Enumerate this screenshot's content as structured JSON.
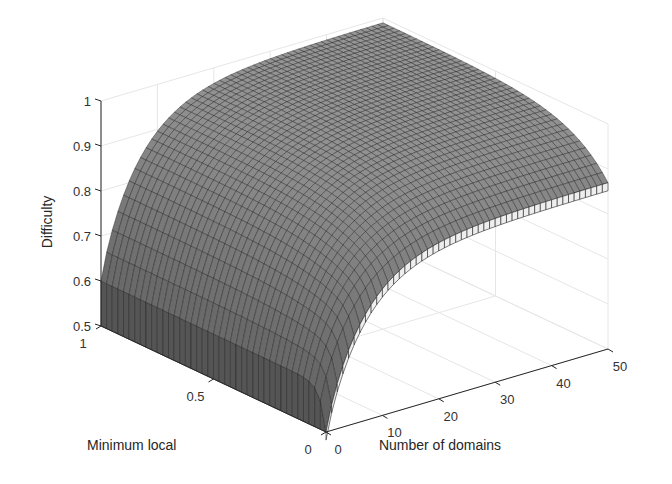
{
  "chart_data": {
    "type": "surface3d",
    "title": "",
    "xlabel": "Number of domains",
    "ylabel": "Minimum local",
    "zlabel": "Difficulty",
    "xlim": [
      0,
      50
    ],
    "ylim": [
      0,
      1
    ],
    "zlim": [
      0.5,
      1
    ],
    "x_ticks": [
      "0",
      "10",
      "20",
      "30",
      "40",
      "50"
    ],
    "y_ticks": [
      "0",
      "0.5",
      "1"
    ],
    "z_ticks": [
      "0.5",
      "0.6",
      "0.7",
      "0.8",
      "0.9",
      "1"
    ],
    "grid": true,
    "colormap": "gray",
    "sample_points": [
      {
        "x": 0,
        "y": 1.0,
        "z": 0.61
      },
      {
        "x": 0,
        "y": 0.5,
        "z": 0.6
      },
      {
        "x": 0,
        "y": 0.1,
        "z": 0.58
      },
      {
        "x": 0,
        "y": 0.0,
        "z": 0.5
      },
      {
        "x": 5,
        "y": 1.0,
        "z": 0.8
      },
      {
        "x": 10,
        "y": 1.0,
        "z": 0.88
      },
      {
        "x": 25,
        "y": 1.0,
        "z": 0.95
      },
      {
        "x": 50,
        "y": 1.0,
        "z": 0.98
      },
      {
        "x": 10,
        "y": 0.0,
        "z": 0.76
      },
      {
        "x": 25,
        "y": 0.0,
        "z": 0.84
      },
      {
        "x": 50,
        "y": 0.0,
        "z": 0.87
      }
    ]
  },
  "axes": {
    "z_label": "Difficulty",
    "x_label": "Number of domains",
    "y_label": "Minimum local"
  }
}
